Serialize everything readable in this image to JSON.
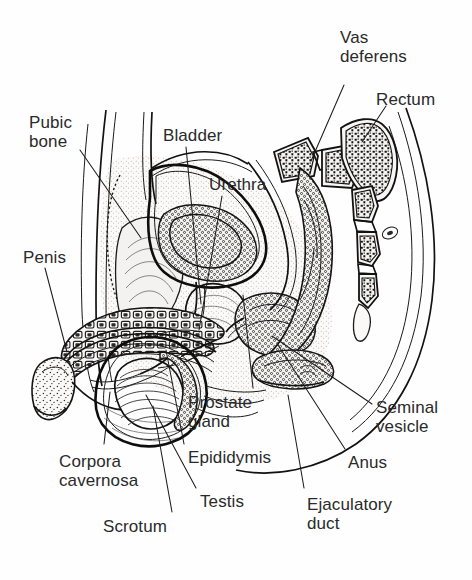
{
  "figure": {
    "background_color": "#fefefe",
    "ink_color": "#1a1a1a",
    "text_color": "#2a2a2a",
    "width": 472,
    "height": 580
  },
  "labels": [
    {
      "id": "vas-deferens",
      "line1": "Vas",
      "line2": "deferens",
      "x": 340,
      "y": 28,
      "align": "left"
    },
    {
      "id": "rectum",
      "line1": "Rectum",
      "line2": "",
      "x": 376,
      "y": 90,
      "align": "left"
    },
    {
      "id": "pubic-bone",
      "line1": "Pubic",
      "line2": "bone",
      "x": 29,
      "y": 113,
      "align": "left"
    },
    {
      "id": "bladder",
      "line1": "Bladder",
      "line2": "",
      "x": 163,
      "y": 126,
      "align": "left"
    },
    {
      "id": "urethra",
      "line1": "Urethra",
      "line2": "",
      "x": 209,
      "y": 175,
      "align": "left"
    },
    {
      "id": "penis",
      "line1": "Penis",
      "line2": "",
      "x": 23,
      "y": 248,
      "align": "left"
    },
    {
      "id": "prostate-gland",
      "line1": "Prostate",
      "line2": "gland",
      "x": 188,
      "y": 393,
      "align": "left"
    },
    {
      "id": "seminal-vesicle",
      "line1": "Seminal",
      "line2": "vesicle",
      "x": 376,
      "y": 398,
      "align": "left"
    },
    {
      "id": "corpora-cavernosa",
      "line1": "Corpora",
      "line2": "cavernosa",
      "x": 59,
      "y": 452,
      "align": "left"
    },
    {
      "id": "epididymis",
      "line1": "Epididymis",
      "line2": "",
      "x": 188,
      "y": 448,
      "align": "left"
    },
    {
      "id": "anus",
      "line1": "Anus",
      "line2": "",
      "x": 348,
      "y": 453,
      "align": "left"
    },
    {
      "id": "testis",
      "line1": "Testis",
      "line2": "",
      "x": 200,
      "y": 492,
      "align": "left"
    },
    {
      "id": "ejaculatory-duct",
      "line1": "Ejaculatory",
      "line2": "duct",
      "x": 307,
      "y": 495,
      "align": "left"
    },
    {
      "id": "scrotum",
      "line1": "Scrotum",
      "line2": "",
      "x": 103,
      "y": 517,
      "align": "left"
    }
  ],
  "leader_lines": [
    {
      "id": "vas-deferens-leader",
      "points": "344,85 311,161"
    },
    {
      "id": "rectum-leader",
      "points": "386,106 362,142"
    },
    {
      "id": "pubic-bone-leader",
      "points": "80,150 141,238"
    },
    {
      "id": "bladder-leader",
      "points": "186,147 201,304"
    },
    {
      "id": "urethra-leader",
      "points": "222,196 199,330"
    },
    {
      "id": "penis-leader",
      "points": "45,268 67,352"
    },
    {
      "id": "prostate-gland-leader",
      "points": "253,388 243,295"
    },
    {
      "id": "seminal-vesicle-leader",
      "points": "372,404 272,336"
    },
    {
      "id": "corpora-cavernosa-leader",
      "points": "104,444 110,392"
    },
    {
      "id": "epididymis-leader",
      "points": "184,444 166,350"
    },
    {
      "id": "anus-leader",
      "points": "345,449 278,345"
    },
    {
      "id": "testis-leader",
      "points": "196,488 146,395"
    },
    {
      "id": "ejaculatory-duct-leader",
      "points": "304,488 288,395"
    },
    {
      "id": "scrotum-leader",
      "points": "172,512 153,406"
    }
  ],
  "structures": [
    {
      "id": "pubic-bone",
      "name": "Pubic bone"
    },
    {
      "id": "bladder",
      "name": "Bladder"
    },
    {
      "id": "urethra",
      "name": "Urethra"
    },
    {
      "id": "penis-shaft",
      "name": "Penis"
    },
    {
      "id": "corpora-cavernosa",
      "name": "Corpora cavernosa"
    },
    {
      "id": "testis",
      "name": "Testis"
    },
    {
      "id": "epididymis",
      "name": "Epididymis"
    },
    {
      "id": "scrotum",
      "name": "Scrotum"
    },
    {
      "id": "prostate-gland",
      "name": "Prostate gland"
    },
    {
      "id": "seminal-vesicle",
      "name": "Seminal vesicle"
    },
    {
      "id": "ejaculatory-duct",
      "name": "Ejaculatory duct"
    },
    {
      "id": "vas-deferens",
      "name": "Vas deferens"
    },
    {
      "id": "rectum",
      "name": "Rectum"
    },
    {
      "id": "anus",
      "name": "Anus"
    },
    {
      "id": "sacrum-vertebrae",
      "name": "Sacrum and vertebrae"
    },
    {
      "id": "buttock-outline",
      "name": "Buttock outline"
    }
  ]
}
